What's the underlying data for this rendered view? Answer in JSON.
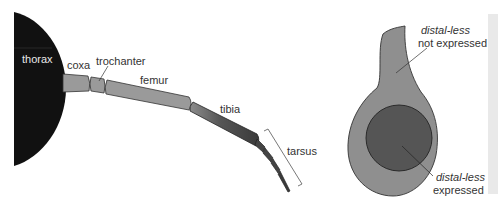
{
  "figure": {
    "left_panel": {
      "title": "insect leg",
      "body_part": {
        "label": "thorax"
      },
      "segments": [
        {
          "id": "coxa",
          "label": "coxa"
        },
        {
          "id": "trochanter",
          "label": "trochanter"
        },
        {
          "id": "femur",
          "label": "femur"
        },
        {
          "id": "tibia",
          "label": "tibia"
        },
        {
          "id": "tarsus",
          "label": "tarsus"
        }
      ]
    },
    "right_panel": {
      "title": "leg imaginal disc",
      "outer_region": {
        "gene": "distal-less",
        "state": "not expressed"
      },
      "inner_region": {
        "gene": "distal-less",
        "state": "expressed"
      }
    },
    "colors": {
      "thorax": "#111111",
      "segment_light": "#9a9a9a",
      "segment_dark": "#3c3c3c",
      "disc_outer": "#8f8f8f",
      "disc_inner": "#555555",
      "label": "#333333",
      "side_panel": "#e9e9e9"
    }
  }
}
